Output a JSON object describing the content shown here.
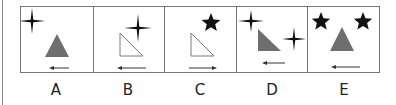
{
  "colors": {
    "border": "#777777",
    "fill_gray": "#6e6e6e",
    "outline": "#7a7a7a",
    "ink": "#111111"
  },
  "options": [
    {
      "label": "A",
      "shapes": [
        {
          "type": "four-point-star",
          "position": "top-left"
        },
        {
          "type": "triangle",
          "style": "gray-filled",
          "position": "center"
        },
        {
          "type": "arrow",
          "direction": "left",
          "position": "bottom"
        }
      ]
    },
    {
      "label": "B",
      "shapes": [
        {
          "type": "four-point-star",
          "position": "top-right"
        },
        {
          "type": "right-triangle",
          "style": "outline",
          "position": "center"
        },
        {
          "type": "arrow",
          "direction": "left",
          "position": "bottom"
        }
      ]
    },
    {
      "label": "C",
      "shapes": [
        {
          "type": "five-point-star",
          "position": "top-right"
        },
        {
          "type": "right-triangle",
          "style": "outline",
          "position": "center"
        },
        {
          "type": "arrow",
          "direction": "right",
          "position": "bottom"
        }
      ]
    },
    {
      "label": "D",
      "shapes": [
        {
          "type": "four-point-star",
          "position": "top-left"
        },
        {
          "type": "right-triangle",
          "style": "gray-filled",
          "position": "center"
        },
        {
          "type": "four-point-star",
          "position": "middle-right"
        },
        {
          "type": "arrow",
          "direction": "left",
          "position": "bottom"
        }
      ]
    },
    {
      "label": "E",
      "shapes": [
        {
          "type": "five-point-star",
          "position": "top-left"
        },
        {
          "type": "five-point-star",
          "position": "top-right"
        },
        {
          "type": "triangle",
          "style": "gray-filled",
          "position": "center"
        },
        {
          "type": "arrow",
          "direction": "left",
          "position": "bottom"
        }
      ]
    }
  ]
}
